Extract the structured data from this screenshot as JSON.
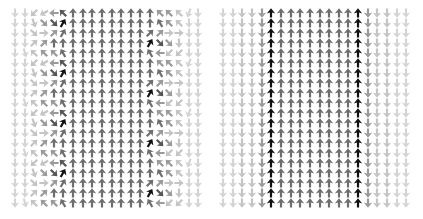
{
  "figure": {
    "panels": [
      {
        "id": "left",
        "description": "vector field with two columns of periodic vortices",
        "cols": 20,
        "rows": 20,
        "origin": [
          5,
          5
        ],
        "spacing": [
          9.65,
          10.0
        ]
      },
      {
        "id": "right",
        "description": "uniform vector field: upward band between two black boundary columns, downward outside",
        "cols": 20,
        "rows": 20,
        "origin": [
          5,
          5
        ],
        "spacing": [
          9.65,
          10.0
        ]
      }
    ],
    "tones": {
      "black": "#111111",
      "dark": "#555555",
      "mid": "#6e6e6e",
      "soft": "#9a9a9a",
      "light": "#c4c4c4",
      "faint": "#d4d4d4"
    },
    "left_pattern": {
      "left_vortex_phases": [
        {
          "angles": [
            180,
            180,
            225,
            240,
            270,
            315
          ],
          "tones": [
            "faint",
            "faint",
            "light",
            "light",
            "soft",
            "dark"
          ]
        },
        {
          "angles": [
            180,
            180,
            160,
            135,
            135,
            30
          ],
          "tones": [
            "faint",
            "faint",
            "light",
            "soft",
            "dark",
            "black"
          ]
        },
        {
          "angles": [
            180,
            180,
            135,
            90,
            45,
            30
          ],
          "tones": [
            "faint",
            "faint",
            "light",
            "light",
            "soft",
            "mid"
          ]
        },
        {
          "angles": [
            180,
            180,
            45,
            45,
            0,
            0
          ],
          "tones": [
            "faint",
            "faint",
            "light",
            "soft",
            "mid",
            "mid"
          ]
        },
        {
          "angles": [
            180,
            165,
            315,
            315,
            315,
            330
          ],
          "tones": [
            "faint",
            "faint",
            "light",
            "soft",
            "soft",
            "mid"
          ]
        }
      ],
      "left_vortex_phase_offset": 0,
      "center_angle": 0,
      "center_tone": "mid",
      "right_vortex_phases": [
        {
          "angles": [
            45,
            45,
            90,
            90,
            180,
            180
          ],
          "tones": [
            "mid",
            "soft",
            "light",
            "light",
            "faint",
            "faint"
          ]
        },
        {
          "angles": [
            30,
            135,
            135,
            180,
            180,
            180
          ],
          "tones": [
            "black",
            "dark",
            "soft",
            "light",
            "faint",
            "faint"
          ]
        },
        {
          "angles": [
            330,
            270,
            225,
            225,
            180,
            180
          ],
          "tones": [
            "mid",
            "soft",
            "light",
            "light",
            "faint",
            "faint"
          ]
        },
        {
          "angles": [
            0,
            315,
            315,
            315,
            200,
            180
          ],
          "tones": [
            "mid",
            "soft",
            "soft",
            "light",
            "faint",
            "faint"
          ]
        },
        {
          "angles": [
            0,
            330,
            315,
            315,
            180,
            180
          ],
          "tones": [
            "mid",
            "mid",
            "soft",
            "light",
            "faint",
            "faint"
          ]
        }
      ],
      "right_vortex_phase_offset": 2
    },
    "right_pattern": {
      "columns": [
        {
          "angle": 180,
          "tone": "faint"
        },
        {
          "angle": 180,
          "tone": "faint"
        },
        {
          "angle": 180,
          "tone": "light"
        },
        {
          "angle": 180,
          "tone": "light"
        },
        {
          "angle": 180,
          "tone": "soft"
        },
        {
          "angle": 0,
          "tone": "black"
        },
        {
          "angle": 0,
          "tone": "mid"
        },
        {
          "angle": 0,
          "tone": "mid"
        },
        {
          "angle": 0,
          "tone": "mid"
        },
        {
          "angle": 0,
          "tone": "mid"
        },
        {
          "angle": 0,
          "tone": "mid"
        },
        {
          "angle": 0,
          "tone": "mid"
        },
        {
          "angle": 0,
          "tone": "mid"
        },
        {
          "angle": 0,
          "tone": "mid"
        },
        {
          "angle": 0,
          "tone": "black"
        },
        {
          "angle": 180,
          "tone": "soft"
        },
        {
          "angle": 180,
          "tone": "light"
        },
        {
          "angle": 180,
          "tone": "light"
        },
        {
          "angle": 180,
          "tone": "faint"
        },
        {
          "angle": 180,
          "tone": "faint"
        }
      ]
    }
  }
}
